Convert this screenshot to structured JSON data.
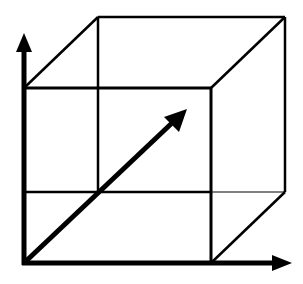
{
  "diagram": {
    "title": "",
    "stroke_color": "#000000",
    "background_color": "#ffffff",
    "front_face": {
      "x1": 24,
      "y1": 88,
      "x2": 211,
      "y2": 263
    },
    "back_face": {
      "x1": 98,
      "y1": 17,
      "x2": 285,
      "y2": 192
    },
    "axes": [
      {
        "name": "y-axis",
        "from": [
          24,
          263
        ],
        "to": [
          24,
          35
        ]
      },
      {
        "name": "x-axis",
        "from": [
          24,
          263
        ],
        "to": [
          290,
          263
        ]
      },
      {
        "name": "z-axis",
        "from": [
          24,
          263
        ],
        "to": [
          186,
          110
        ]
      }
    ]
  }
}
